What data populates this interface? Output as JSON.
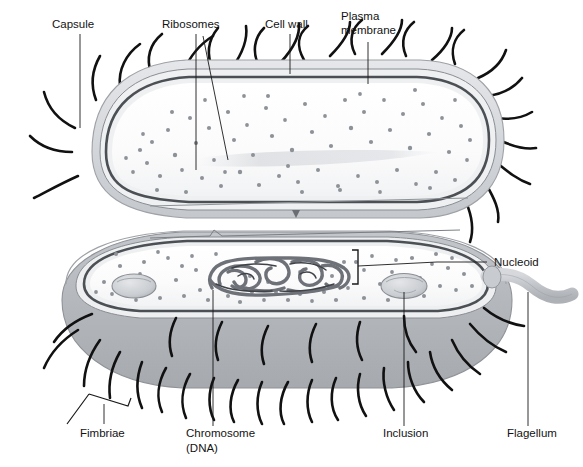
{
  "figure": {
    "background_color": "#ffffff",
    "width": 583,
    "height": 467
  },
  "labels": {
    "capsule": "Capsule",
    "ribosomes": "Ribosomes",
    "cell_wall": "Cell wall",
    "plasma_membrane_line1": "Plasma",
    "plasma_membrane_line2": "membrane",
    "nucleoid": "Nucleoid",
    "fimbriae": "Fimbriae",
    "chromosome_line1": "Chromosome",
    "chromosome_line2": "(DNA)",
    "inclusion": "Inclusion",
    "flagellum": "Flagellum"
  },
  "colors": {
    "label_text": "#131313",
    "leader_line": "#1a1a1a",
    "capsule_fill": "#d8dade",
    "capsule_edge": "#b9bcc2",
    "cell_wall_dark": "#6a6e74",
    "cell_wall_light": "#e9eaec",
    "plasma_membrane": "#4c5055",
    "cytoplasm": "#fafafa",
    "cytoplasm_shadow": "#e4e6e9",
    "ribosome_dot": "#8d9298",
    "nucleoid_strand": "#6e7278",
    "nucleoid_strand_dark": "#3f4348",
    "inclusion_fill": "#cdd0d4",
    "inclusion_edge": "#8b8f95",
    "body_gray": "#b6b9bd",
    "body_gray_dark": "#9da0a5",
    "flagellum_fill": "#c3c6ca",
    "flagellum_edge": "#9a9da2",
    "appendage_dark": "#111111"
  },
  "structures": [
    {
      "name": "capsule",
      "description": "outer light-gray halo layer surrounding the cell"
    },
    {
      "name": "cell-wall",
      "description": "dark banded layer beneath the capsule"
    },
    {
      "name": "plasma-membrane",
      "description": "innermost dark line enclosing cytoplasm"
    },
    {
      "name": "cytoplasm",
      "description": "pale interior containing ribosomes"
    },
    {
      "name": "ribosomes",
      "description": "small gray dots scattered through cytoplasm"
    },
    {
      "name": "nucleoid",
      "description": "tangled DNA loop mass in lower cell interior"
    },
    {
      "name": "chromosome-dna",
      "description": "the circular DNA comprising the nucleoid"
    },
    {
      "name": "inclusion",
      "description": "oval storage granule bodies in cytoplasm"
    },
    {
      "name": "fimbriae",
      "description": "numerous short dark hair-like appendages"
    },
    {
      "name": "flagellum",
      "description": "single long thick tubular appendage at right"
    }
  ],
  "counts": {
    "inclusions_visible": 2,
    "flagella_visible": 1
  }
}
